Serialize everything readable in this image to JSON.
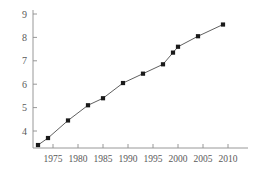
{
  "chart_data": {
    "type": "line",
    "title": "",
    "subtitle": "",
    "xlabel": "",
    "ylabel": "",
    "xlim": [
      1971,
      2011
    ],
    "ylim": [
      3.1,
      9.2
    ],
    "grid": false,
    "legend": null,
    "marker": "filled-square",
    "line_color": "#4d4d4d",
    "marker_color": "#1a1a1a",
    "axis_color": "#8c8c8c",
    "label_color": "#595959",
    "x_ticks": [
      1975,
      1980,
      1985,
      1990,
      1995,
      2000,
      2005,
      2010
    ],
    "x_tick_labels": [
      "1975",
      "1980",
      "1985",
      "1990",
      "1995",
      "2000",
      "2005",
      "2010"
    ],
    "y_ticks": [
      4,
      5,
      6,
      7,
      8,
      9
    ],
    "y_tick_labels": [
      "4",
      "5",
      "6",
      "7",
      "8",
      "9"
    ],
    "x": [
      1972,
      1974,
      1978,
      1982,
      1985,
      1989,
      1993,
      1997,
      1999,
      2000,
      2004,
      2009
    ],
    "values": [
      3.4,
      3.7,
      4.45,
      5.1,
      5.4,
      6.05,
      6.45,
      6.85,
      7.35,
      7.6,
      8.05,
      8.55
    ],
    "series": [
      {
        "name": "series-1",
        "x": [
          1972,
          1974,
          1978,
          1982,
          1985,
          1989,
          1993,
          1997,
          1999,
          2000,
          2004,
          2009
        ],
        "values": [
          3.4,
          3.7,
          4.45,
          5.1,
          5.4,
          6.05,
          6.45,
          6.85,
          7.35,
          7.6,
          8.05,
          8.55
        ]
      }
    ]
  }
}
